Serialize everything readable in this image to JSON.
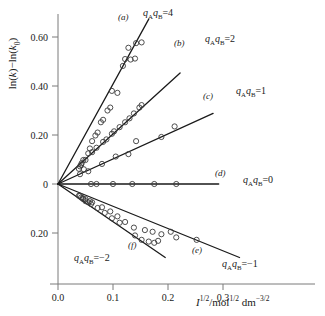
{
  "chart_data": {
    "type": "scatter",
    "title": "",
    "xlabel": "I^1/2 / mol^1/2 dm^-3/2",
    "ylabel": "ln(k) - ln(k_0)",
    "xlim": [
      0.0,
      0.355
    ],
    "ylim": [
      -0.3,
      0.7
    ],
    "xticks": [
      0.0,
      0.1,
      0.2,
      0.3
    ],
    "xticklabels": [
      "0.0",
      "0.1",
      "0.2",
      "0.3"
    ],
    "yticks": [
      0.6,
      0.4,
      0.2,
      0.0,
      -0.2
    ],
    "yticklabels": [
      "0.60",
      "0.40",
      "0.20",
      "0",
      "0.20"
    ],
    "grid": false,
    "legend": "inline-annotations",
    "theory_note": "Bronsted-Bjerrum kinetic salt effect; slope = 1.02 * qA*qB",
    "series": [
      {
        "id": "a",
        "name": "qA qB = 4",
        "charge_product": 4,
        "slope": 4.08,
        "line": [
          [
            0.0,
            0.0
          ],
          [
            0.165,
            0.673
          ]
        ],
        "points": [
          [
            0.04,
            0.072
          ],
          [
            0.043,
            0.085
          ],
          [
            0.046,
            0.098
          ],
          [
            0.047,
            0.06
          ],
          [
            0.055,
            0.125
          ],
          [
            0.058,
            0.145
          ],
          [
            0.062,
            0.175
          ],
          [
            0.068,
            0.198
          ],
          [
            0.072,
            0.21
          ],
          [
            0.078,
            0.252
          ],
          [
            0.082,
            0.262
          ],
          [
            0.09,
            0.3
          ],
          [
            0.095,
            0.312
          ],
          [
            0.098,
            0.38
          ],
          [
            0.108,
            0.372
          ],
          [
            0.118,
            0.482
          ],
          [
            0.122,
            0.51
          ],
          [
            0.128,
            0.556
          ],
          [
            0.132,
            0.508
          ],
          [
            0.14,
            0.512
          ],
          [
            0.142,
            0.575
          ],
          [
            0.152,
            0.578
          ]
        ]
      },
      {
        "id": "b",
        "name": "qA qB = 2",
        "charge_product": 2,
        "slope": 2.04,
        "line": [
          [
            0.0,
            0.0
          ],
          [
            0.222,
            0.453
          ]
        ],
        "points": [
          [
            0.038,
            0.062
          ],
          [
            0.042,
            0.078
          ],
          [
            0.05,
            0.098
          ],
          [
            0.062,
            0.13
          ],
          [
            0.07,
            0.148
          ],
          [
            0.082,
            0.172
          ],
          [
            0.088,
            0.182
          ],
          [
            0.098,
            0.205
          ],
          [
            0.102,
            0.215
          ],
          [
            0.112,
            0.232
          ],
          [
            0.122,
            0.252
          ],
          [
            0.13,
            0.268
          ],
          [
            0.138,
            0.288
          ],
          [
            0.148,
            0.312
          ],
          [
            0.152,
            0.322
          ]
        ]
      },
      {
        "id": "c",
        "name": "qA qB = 1",
        "charge_product": 1,
        "slope": 1.02,
        "line": [
          [
            0.0,
            0.0
          ],
          [
            0.282,
            0.288
          ]
        ],
        "points": [
          [
            0.04,
            0.04
          ],
          [
            0.055,
            0.052
          ],
          [
            0.08,
            0.082
          ],
          [
            0.105,
            0.112
          ],
          [
            0.128,
            0.122
          ],
          [
            0.142,
            0.175
          ],
          [
            0.188,
            0.192
          ],
          [
            0.212,
            0.235
          ]
        ]
      },
      {
        "id": "d",
        "name": "qA qB = 0",
        "charge_product": 0,
        "slope": 0.0,
        "line": [
          [
            0.0,
            0.0
          ],
          [
            0.292,
            0.0
          ]
        ],
        "points": [
          [
            0.06,
            0.0
          ],
          [
            0.07,
            0.0
          ],
          [
            0.1,
            0.0
          ],
          [
            0.135,
            0.0
          ],
          [
            0.175,
            0.0
          ],
          [
            0.215,
            0.0
          ]
        ]
      },
      {
        "id": "e",
        "name": "qA qB = -1",
        "charge_product": -1,
        "slope": -1.02,
        "line": [
          [
            0.0,
            0.0
          ],
          [
            0.33,
            -0.3
          ]
        ],
        "points": [
          [
            0.04,
            -0.048
          ],
          [
            0.045,
            -0.058
          ],
          [
            0.05,
            -0.062
          ],
          [
            0.058,
            -0.07
          ],
          [
            0.062,
            -0.075
          ],
          [
            0.08,
            -0.095
          ],
          [
            0.095,
            -0.112
          ],
          [
            0.108,
            -0.132
          ],
          [
            0.122,
            -0.155
          ],
          [
            0.138,
            -0.178
          ],
          [
            0.158,
            -0.188
          ],
          [
            0.172,
            -0.195
          ],
          [
            0.188,
            -0.205
          ],
          [
            0.205,
            -0.195
          ],
          [
            0.215,
            -0.218
          ],
          [
            0.252,
            -0.228
          ]
        ]
      },
      {
        "id": "f",
        "name": "qA qB = -2",
        "charge_product": -2,
        "slope": -2.04,
        "line": [
          [
            0.0,
            0.0
          ],
          [
            0.195,
            -0.3
          ]
        ],
        "points": [
          [
            0.038,
            -0.048
          ],
          [
            0.042,
            -0.055
          ],
          [
            0.046,
            -0.062
          ],
          [
            0.05,
            -0.07
          ],
          [
            0.055,
            -0.075
          ],
          [
            0.06,
            -0.082
          ],
          [
            0.072,
            -0.098
          ],
          [
            0.085,
            -0.118
          ],
          [
            0.098,
            -0.14
          ],
          [
            0.112,
            -0.158
          ],
          [
            0.14,
            -0.21
          ],
          [
            0.152,
            -0.228
          ],
          [
            0.165,
            -0.235
          ],
          [
            0.175,
            -0.24
          ],
          [
            0.182,
            -0.232
          ]
        ]
      }
    ]
  },
  "axes": {
    "y_label_pre": "ln(",
    "y_label_k": "k",
    "y_label_mid": ")−ln(",
    "y_label_k0": "k",
    "y_label_k0sub": "0",
    "y_label_post": ")",
    "x_label_I": "I",
    "x_label_I_sup": "1/2",
    "x_label_slash": "/mol",
    "x_label_mol_sup": "1/2",
    "x_label_dm": "dm",
    "x_label_dm_sup": "−3/2",
    "xticklabels": [
      "0.0",
      "0.1",
      "0.2",
      "0.3"
    ],
    "yticklabels": [
      "0.60",
      "0.40",
      "0.20",
      "0",
      "0.20"
    ]
  },
  "annotations": {
    "a": {
      "id": "(a)",
      "q_a": "q",
      "sub_a": "A",
      "q_b": "q",
      "sub_b": "B",
      "eq": "=4"
    },
    "b": {
      "id": "(b)",
      "q_a": "q",
      "sub_a": "A",
      "q_b": "q",
      "sub_b": "B",
      "eq": "=2"
    },
    "c": {
      "id": "(c)",
      "q_a": "q",
      "sub_a": "A",
      "q_b": "q",
      "sub_b": "B",
      "eq": "=1"
    },
    "d": {
      "id": "(d)",
      "q_a": "q",
      "sub_a": "A",
      "q_b": "q",
      "sub_b": "B",
      "eq": "=0"
    },
    "e": {
      "id": "(e)",
      "q_a": "q",
      "sub_a": "A",
      "q_b": "q",
      "sub_b": "B",
      "eq": "=−1"
    },
    "f": {
      "id": "(f)",
      "q_a": "q",
      "sub_a": "A",
      "q_b": "q",
      "sub_b": "B",
      "eq": "=−2"
    }
  },
  "style": {
    "axis_color": "#7a7a7a",
    "line_color": "#1a1a1a",
    "marker_color": "#3a3a3a",
    "text_color": "#1a1a1a",
    "background": "#ffffff"
  }
}
